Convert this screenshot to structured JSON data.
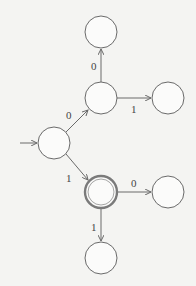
{
  "diagram": {
    "type": "finite-automaton",
    "colors": {
      "background": "#f4f4f2",
      "stroke": "#6a6a6a"
    },
    "nodes": [
      {
        "id": "start",
        "cx": 54,
        "cy": 143,
        "r": 16,
        "accepting": false,
        "initial": true
      },
      {
        "id": "n1",
        "cx": 101,
        "cy": 98,
        "r": 16,
        "accepting": false
      },
      {
        "id": "n2",
        "cx": 101,
        "cy": 192,
        "r": 16,
        "accepting": true
      },
      {
        "id": "n3",
        "cx": 101,
        "cy": 32,
        "r": 16,
        "accepting": false
      },
      {
        "id": "n4",
        "cx": 168,
        "cy": 98,
        "r": 16,
        "accepting": false
      },
      {
        "id": "n5",
        "cx": 168,
        "cy": 192,
        "r": 16,
        "accepting": false
      },
      {
        "id": "n6",
        "cx": 101,
        "cy": 258,
        "r": 16,
        "accepting": false
      }
    ],
    "edges": [
      {
        "from": "start",
        "to": "n1",
        "label": "0"
      },
      {
        "from": "start",
        "to": "n2",
        "label": "1"
      },
      {
        "from": "n1",
        "to": "n3",
        "label": "0"
      },
      {
        "from": "n1",
        "to": "n4",
        "label": "1"
      },
      {
        "from": "n2",
        "to": "n5",
        "label": "0"
      },
      {
        "from": "n2",
        "to": "n6",
        "label": "1"
      }
    ],
    "labels": {
      "start_n1": "0",
      "start_n2": "1",
      "n1_n3": "0",
      "n1_n4": "1",
      "n2_n5": "0",
      "n2_n6": "1"
    }
  }
}
